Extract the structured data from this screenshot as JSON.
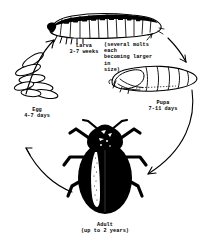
{
  "figure": {
    "background_color": "#ffffff",
    "ink_color": "#000000"
  },
  "stages": {
    "larva": {
      "name": "Larva",
      "duration": "3-7 weeks",
      "note": "(several molts each\nbecoming larger in\nsize)"
    },
    "pupa": {
      "name": "Pupa",
      "duration": "7-11 days"
    },
    "egg": {
      "name": "Egg",
      "duration": "4-7 days"
    },
    "adult": {
      "name": "Adult",
      "duration": "(up to 2 years)"
    }
  },
  "labels": {
    "larva_text": "Larva\n3-7 weeks",
    "molts_text": "(several molts each\nbecoming larger in\nsize)",
    "pupa_text": "Pupa\n7-11 days",
    "egg_text": "Egg\n4-7 days",
    "adult_text": "Adult\n(up to 2 years)"
  },
  "arrows": [
    {
      "name": "egg-to-larva",
      "from": "egg",
      "to": "larva",
      "direction": "up-right"
    },
    {
      "name": "larva-to-pupa",
      "from": "larva",
      "to": "pupa",
      "direction": "down-right"
    },
    {
      "name": "pupa-to-adult",
      "from": "pupa",
      "to": "adult",
      "direction": "down-left"
    },
    {
      "name": "adult-to-egg",
      "from": "adult",
      "to": "egg",
      "direction": "up-left"
    }
  ]
}
